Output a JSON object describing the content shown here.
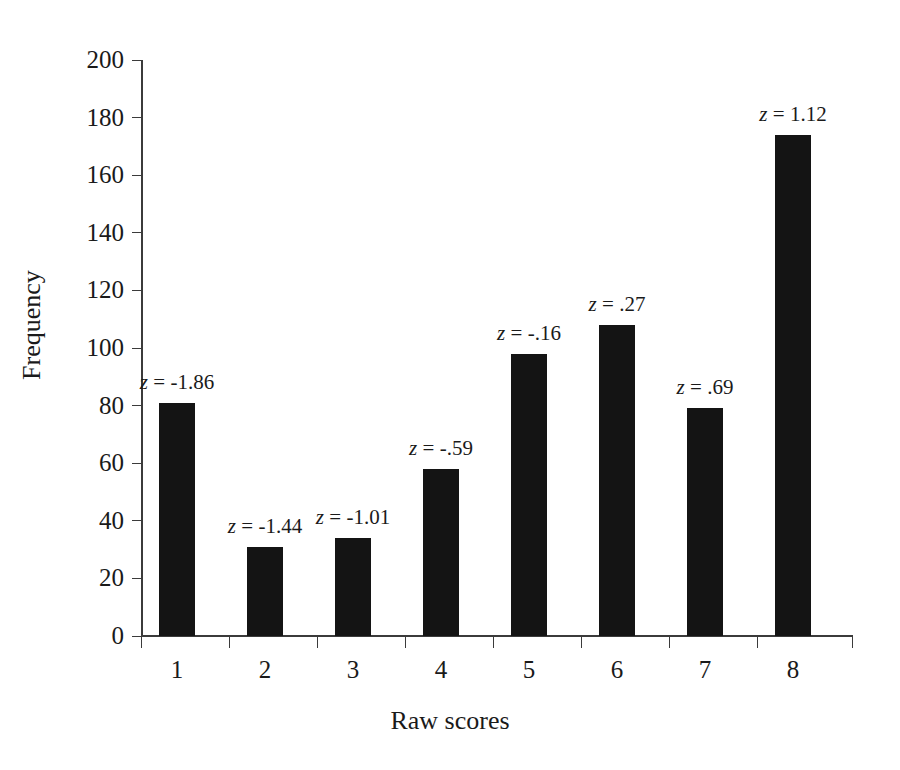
{
  "chart_data": {
    "type": "bar",
    "title": "",
    "subtitle": "",
    "xlabel": "Raw scores",
    "ylabel": "Frequency",
    "categories": [
      "1",
      "2",
      "3",
      "4",
      "5",
      "6",
      "7",
      "8"
    ],
    "values": [
      81,
      31,
      34,
      58,
      98,
      108,
      79,
      174
    ],
    "ylim": [
      0,
      200
    ],
    "yticks": [
      0,
      20,
      40,
      60,
      80,
      100,
      120,
      140,
      160,
      180,
      200
    ],
    "ytick_labels": [
      "0",
      "20",
      "40",
      "60",
      "80",
      "100",
      "120",
      "140",
      "160",
      "180",
      "200"
    ],
    "grid": false,
    "legend": null,
    "bar_color": "#141414",
    "axis_color": "#3b3b3b",
    "background_color": "#ffffff",
    "annotations": [
      {
        "category": "1",
        "symbol": "z",
        "text": "= -1.86",
        "value": -1.86
      },
      {
        "category": "2",
        "symbol": "z",
        "text": "= -1.44",
        "value": -1.44
      },
      {
        "category": "3",
        "symbol": "z",
        "text": "= -1.01",
        "value": -1.01
      },
      {
        "category": "4",
        "symbol": "z",
        "text": "= -.59",
        "value": -0.59
      },
      {
        "category": "5",
        "symbol": "z",
        "text": "= -.16",
        "value": -0.16
      },
      {
        "category": "6",
        "symbol": "z",
        "text": "= .27",
        "value": 0.27
      },
      {
        "category": "7",
        "symbol": "z",
        "text": "= .69",
        "value": 0.69
      },
      {
        "category": "8",
        "symbol": "z",
        "text": "= 1.12",
        "value": 1.12
      }
    ]
  },
  "layout": {
    "plot_left": 141,
    "plot_right": 853,
    "y_zero_px": 636,
    "y_top_px": 60,
    "px_per_unit": 2.88,
    "bar_width": 36,
    "category_step": 88,
    "first_bar_left": 159
  }
}
